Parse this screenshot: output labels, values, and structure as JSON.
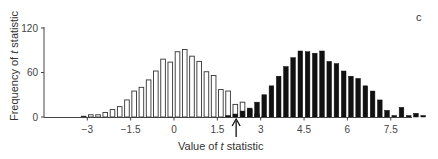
{
  "chart_data": {
    "type": "bar",
    "title": "",
    "panel_label": "c",
    "xlabel_prefix": "Value of ",
    "xlabel_italic": "t",
    "xlabel_suffix": " statistic",
    "ylabel_prefix": "Frequency of ",
    "ylabel_italic": "t",
    "ylabel_suffix": " statistic",
    "ylim": [
      0,
      120
    ],
    "yticks": [
      0,
      60,
      120
    ],
    "xlim": [
      -4.5,
      8.25
    ],
    "xticks": [
      -3,
      -1.5,
      0,
      1.5,
      3,
      4.5,
      6,
      7.5
    ],
    "xtick_labels": [
      "−3",
      "−1.5",
      "0",
      "1.5",
      "3",
      "4.5",
      "6",
      "7.5"
    ],
    "bin_width": 0.25,
    "grid": false,
    "legend": null,
    "annotation": {
      "type": "arrow",
      "x": 2.15,
      "direction": "up",
      "label": ""
    },
    "series": [
      {
        "name": "null distribution",
        "style": "open",
        "bin_start": -3.25,
        "values": [
          1,
          3,
          3,
          6,
          10,
          14,
          23,
          35,
          40,
          50,
          62,
          78,
          74,
          88,
          91,
          82,
          75,
          61,
          56,
          37,
          35,
          17,
          20,
          10,
          4,
          1
        ]
      },
      {
        "name": "alternative distribution",
        "style": "filled",
        "bin_start": 1.75,
        "values": [
          2,
          4,
          8,
          12,
          20,
          30,
          42,
          55,
          68,
          80,
          89,
          88,
          86,
          89,
          75,
          72,
          62,
          55,
          52,
          42,
          35,
          23,
          9,
          2,
          13,
          2,
          5,
          2
        ]
      }
    ]
  }
}
